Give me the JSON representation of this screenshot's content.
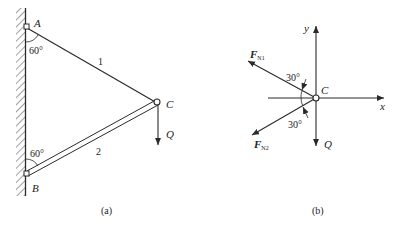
{
  "figure_a": {
    "caption": "(a)",
    "points": {
      "A": "A",
      "B": "B",
      "C": "C"
    },
    "members": {
      "member_1": "1",
      "member_2": "2"
    },
    "angle_A": "60°",
    "angle_B": "60°",
    "load": "Q"
  },
  "figure_b": {
    "caption": "(b)",
    "node": "C",
    "axis_x": "x",
    "axis_y": "y",
    "force_1": {
      "symbol": "F",
      "subscript": "N1"
    },
    "force_2": {
      "symbol": "F",
      "subscript": "N2"
    },
    "angle_upper": "30°",
    "angle_lower": "30°",
    "load": "Q"
  },
  "colors": {
    "ink": "#2a2a2a",
    "background": "#ffffff"
  }
}
